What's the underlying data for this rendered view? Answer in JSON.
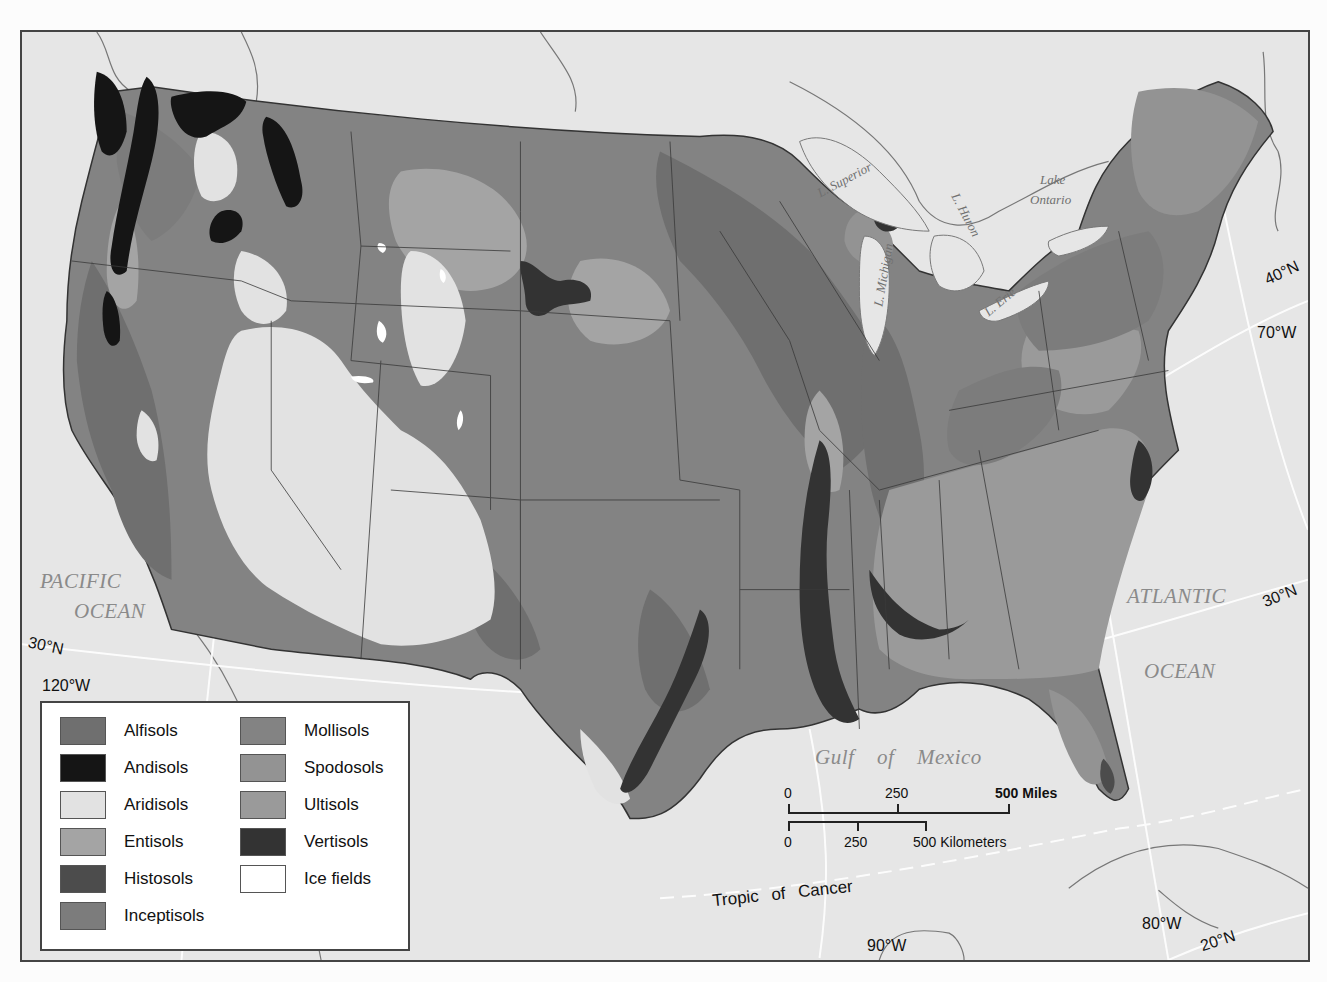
{
  "map": {
    "type": "thematic-map",
    "subject": "Soil orders of the contiguous United States",
    "colors": {
      "ocean_land_background": "#e6e6e6",
      "frame": "#444444",
      "state_border": "#3a3a3a",
      "graticule": "#ffffff"
    }
  },
  "legend": {
    "items": [
      {
        "label": "Alfisols",
        "color": "#6f6f6f"
      },
      {
        "label": "Andisols",
        "color": "#151515"
      },
      {
        "label": "Aridisols",
        "color": "#e2e2e2"
      },
      {
        "label": "Entisols",
        "color": "#a4a4a4"
      },
      {
        "label": "Histosols",
        "color": "#4c4c4c"
      },
      {
        "label": "Inceptisols",
        "color": "#7c7c7c"
      },
      {
        "label": "Mollisols",
        "color": "#838383"
      },
      {
        "label": "Spodosols",
        "color": "#939393"
      },
      {
        "label": "Ultisols",
        "color": "#9a9a9a"
      },
      {
        "label": "Vertisols",
        "color": "#333333"
      },
      {
        "label": "Ice fields",
        "color": "#ffffff"
      }
    ]
  },
  "water_labels": {
    "pacific_1": "PACIFIC",
    "pacific_2": "OCEAN",
    "atlantic_1": "ATLANTIC",
    "atlantic_2": "OCEAN",
    "gulf_1": "Gulf",
    "gulf_2": "of",
    "gulf_3": "Mexico",
    "superior": "L. Superior",
    "michigan": "L. Michigan",
    "huron": "L. Huron",
    "erie": "L. Erie",
    "ontario_1": "Lake",
    "ontario_2": "Ontario"
  },
  "graticule_labels": {
    "lat_30n_west": "30°N",
    "lon_120w": "120°W",
    "lat_40n_east": "40°N",
    "lon_70w": "70°W",
    "lat_30n_east": "30°N",
    "lon_90w": "90°W",
    "lon_80w": "80°W",
    "lat_20n": "20°N",
    "tropic": "Tropic of Cancer"
  },
  "scale_bar": {
    "miles": {
      "ticks": [
        "0",
        "250",
        "500 Miles"
      ]
    },
    "kilometers": {
      "ticks": [
        "0",
        "250",
        "500 Kilometers"
      ]
    }
  }
}
